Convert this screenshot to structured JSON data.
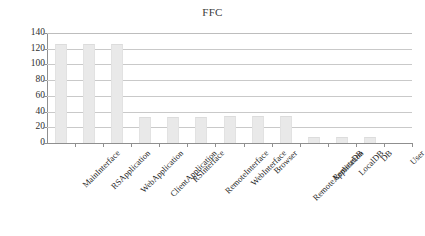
{
  "chart_data": {
    "type": "bar",
    "title": "FFC",
    "xlabel": "",
    "ylabel": "",
    "ylim": [
      0,
      140
    ],
    "ytick_step": 20,
    "yticks": [
      0,
      20,
      40,
      60,
      80,
      100,
      120,
      140
    ],
    "grid": true,
    "legend": false,
    "bar_color": "#e9e9e9",
    "bar_edge_color": "#dcdcdc",
    "gridline_color": "#c9c9c9",
    "axis_color": "#8f8f8f",
    "categories": [
      "MainInterface",
      "RSApplication",
      "WebApplication",
      "ClientApplication",
      "RSInterface",
      "RemoteInterface",
      "WebInterface",
      "Browser",
      "RemoteApplication",
      "RemoteDB",
      "LocalDB",
      "DB",
      "User"
    ],
    "values": [
      126,
      126,
      126,
      33,
      33,
      33,
      34,
      34,
      35,
      8,
      8,
      8,
      0
    ]
  }
}
